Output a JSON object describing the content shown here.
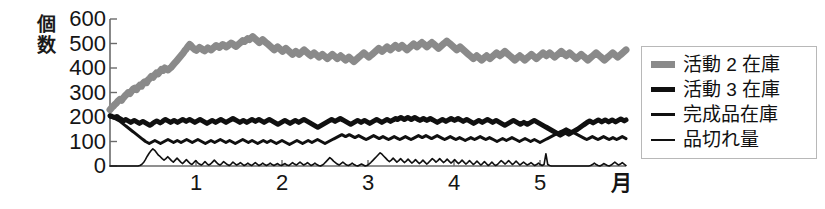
{
  "chart_data": {
    "type": "line",
    "title": "",
    "xlabel": "月",
    "ylabel": "個数",
    "ylim": [
      0,
      600
    ],
    "yticks": [
      0,
      100,
      200,
      300,
      400,
      500,
      600
    ],
    "xlim": [
      0,
      6
    ],
    "xticks": [
      1,
      2,
      3,
      4,
      5
    ],
    "xticklabels": [
      "1",
      "2",
      "3",
      "4",
      "5"
    ],
    "grid": false,
    "legend_position": "right",
    "series": [
      {
        "name": "活動 2 在庫",
        "color": "#8a8a8a",
        "width": 7,
        "values": [
          230,
          238,
          244,
          252,
          258,
          266,
          272,
          268,
          278,
          286,
          292,
          300,
          296,
          306,
          314,
          318,
          312,
          322,
          330,
          326,
          338,
          344,
          340,
          352,
          358,
          366,
          362,
          372,
          380,
          376,
          386,
          394,
          390,
          400,
          396,
          392,
          398,
          404,
          412,
          420,
          428,
          436,
          444,
          452,
          460,
          470,
          478,
          488,
          496,
          490,
          482,
          476,
          472,
          478,
          484,
          480,
          474,
          470,
          476,
          482,
          478,
          474,
          480,
          486,
          492,
          488,
          484,
          490,
          496,
          492,
          486,
          490,
          496,
          502,
          498,
          492,
          488,
          494,
          500,
          506,
          512,
          508,
          514,
          520,
          516,
          522,
          528,
          522,
          516,
          510,
          504,
          510,
          516,
          510,
          504,
          498,
          492,
          486,
          480,
          474,
          480,
          486,
          480,
          474,
          468,
          474,
          480,
          474,
          468,
          462,
          456,
          462,
          468,
          462,
          456,
          462,
          468,
          474,
          468,
          462,
          456,
          450,
          456,
          462,
          456,
          450,
          444,
          450,
          456,
          450,
          444,
          438,
          444,
          450,
          456,
          450,
          444,
          438,
          444,
          450,
          444,
          438,
          432,
          438,
          444,
          438,
          432,
          426,
          432,
          438,
          444,
          450,
          456,
          462,
          456,
          450,
          444,
          450,
          456,
          462,
          468,
          474,
          480,
          474,
          468,
          474,
          480,
          486,
          480,
          474,
          480,
          486,
          492,
          486,
          480,
          486,
          492,
          486,
          480,
          474,
          480,
          486,
          492,
          498,
          492,
          486,
          492,
          498,
          504,
          498,
          492,
          486,
          492,
          498,
          504,
          498,
          492,
          486,
          480,
          486,
          492,
          498,
          504,
          510,
          504,
          498,
          492,
          486,
          480,
          474,
          480,
          486,
          480,
          474,
          468,
          462,
          456,
          450,
          444,
          438,
          444,
          450,
          444,
          438,
          432,
          438,
          444,
          450,
          444,
          438,
          444,
          450,
          456,
          462,
          456,
          450,
          456,
          462,
          468,
          462,
          456,
          450,
          444,
          438,
          432,
          438,
          444,
          450,
          444,
          438,
          432,
          438,
          444,
          450,
          456,
          450,
          444,
          438,
          444,
          450,
          456,
          462,
          456,
          450,
          456,
          462,
          456,
          450,
          444,
          450,
          456,
          462,
          468,
          462,
          456,
          450,
          456,
          462,
          456,
          450,
          444,
          438,
          444,
          450,
          456,
          450,
          444,
          438,
          432,
          438,
          444,
          450,
          456,
          462,
          456,
          450,
          444,
          438,
          432,
          438,
          444,
          450,
          456,
          462,
          456,
          450,
          444,
          450,
          456,
          462,
          468,
          474
        ]
      },
      {
        "name": "活動 3 在庫",
        "color": "#101010",
        "width": 5,
        "values": [
          205,
          203,
          200,
          198,
          202,
          196,
          192,
          188,
          185,
          190,
          186,
          182,
          178,
          182,
          186,
          182,
          178,
          174,
          178,
          182,
          178,
          174,
          170,
          166,
          170,
          176,
          180,
          184,
          180,
          176,
          180,
          186,
          190,
          186,
          182,
          178,
          182,
          186,
          182,
          178,
          182,
          186,
          190,
          186,
          182,
          186,
          190,
          186,
          182,
          178,
          182,
          186,
          190,
          186,
          182,
          178,
          174,
          178,
          182,
          186,
          182,
          178,
          182,
          186,
          190,
          186,
          182,
          178,
          182,
          186,
          190,
          194,
          190,
          186,
          182,
          178,
          182,
          186,
          182,
          178,
          182,
          186,
          190,
          186,
          182,
          186,
          190,
          186,
          182,
          178,
          182,
          186,
          190,
          186,
          182,
          178,
          174,
          170,
          174,
          178,
          182,
          186,
          182,
          178,
          174,
          178,
          182,
          186,
          182,
          178,
          182,
          186,
          190,
          186,
          182,
          178,
          174,
          170,
          166,
          162,
          158,
          162,
          166,
          170,
          174,
          178,
          182,
          186,
          190,
          186,
          182,
          186,
          190,
          194,
          190,
          186,
          182,
          178,
          174,
          170,
          174,
          178,
          182,
          186,
          182,
          178,
          182,
          186,
          182,
          178,
          174,
          178,
          182,
          186,
          190,
          186,
          182,
          178,
          182,
          186,
          190,
          186,
          182,
          186,
          190,
          194,
          190,
          194,
          198,
          194,
          190,
          194,
          198,
          194,
          190,
          194,
          198,
          194,
          190,
          186,
          190,
          194,
          190,
          186,
          190,
          194,
          190,
          186,
          182,
          178,
          182,
          186,
          190,
          186,
          182,
          186,
          190,
          194,
          190,
          186,
          190,
          194,
          190,
          186,
          182,
          186,
          190,
          186,
          182,
          178,
          174,
          178,
          182,
          186,
          182,
          178,
          182,
          186,
          190,
          186,
          182,
          178,
          182,
          186,
          182,
          178,
          174,
          170,
          166,
          170,
          174,
          178,
          182,
          186,
          182,
          178,
          174,
          170,
          174,
          178,
          174,
          170,
          174,
          178,
          182,
          186,
          182,
          178,
          174,
          170,
          166,
          162,
          158,
          154,
          150,
          146,
          142,
          138,
          134,
          130,
          126,
          130,
          134,
          138,
          134,
          130,
          134,
          138,
          142,
          146,
          150,
          155,
          160,
          165,
          170,
          175,
          180,
          184,
          180,
          176,
          180,
          184,
          188,
          184,
          180,
          184,
          188,
          184,
          180,
          184,
          188,
          184,
          180,
          184,
          188,
          192,
          188,
          184,
          188
        ]
      },
      {
        "name": "完成品在庫",
        "color": "#101010",
        "width": 3,
        "values": [
          200,
          198,
          196,
          192,
          188,
          184,
          178,
          172,
          166,
          160,
          154,
          148,
          142,
          136,
          130,
          124,
          118,
          112,
          106,
          100,
          96,
          92,
          96,
          100,
          104,
          100,
          96,
          92,
          96,
          100,
          104,
          108,
          104,
          100,
          96,
          100,
          104,
          100,
          96,
          100,
          104,
          108,
          104,
          100,
          96,
          100,
          104,
          108,
          104,
          100,
          96,
          92,
          96,
          100,
          104,
          100,
          96,
          100,
          104,
          108,
          104,
          100,
          96,
          100,
          104,
          100,
          96,
          92,
          96,
          100,
          104,
          108,
          104,
          100,
          96,
          100,
          104,
          100,
          96,
          92,
          96,
          100,
          104,
          100,
          96,
          100,
          104,
          100,
          96,
          92,
          96,
          100,
          104,
          100,
          96,
          92,
          88,
          92,
          96,
          100,
          104,
          100,
          96,
          92,
          96,
          100,
          104,
          100,
          96,
          100,
          104,
          108,
          104,
          100,
          96,
          92,
          96,
          100,
          104,
          108,
          112,
          116,
          120,
          124,
          128,
          124,
          120,
          124,
          128,
          124,
          120,
          116,
          120,
          124,
          120,
          116,
          112,
          108,
          112,
          116,
          120,
          124,
          120,
          116,
          112,
          116,
          120,
          116,
          112,
          108,
          112,
          116,
          120,
          116,
          112,
          108,
          112,
          116,
          120,
          116,
          112,
          108,
          112,
          116,
          120,
          124,
          120,
          116,
          120,
          124,
          120,
          116,
          112,
          116,
          120,
          124,
          120,
          116,
          112,
          108,
          112,
          116,
          120,
          116,
          112,
          108,
          112,
          116,
          112,
          108,
          104,
          108,
          112,
          116,
          112,
          108,
          112,
          116,
          120,
          116,
          112,
          108,
          112,
          116,
          112,
          108,
          104,
          100,
          104,
          108,
          112,
          108,
          104,
          108,
          112,
          116,
          112,
          108,
          104,
          100,
          104,
          108,
          112,
          108,
          104,
          100,
          104,
          108,
          104,
          100,
          96,
          100,
          104,
          108,
          112,
          116,
          120,
          124,
          128,
          132,
          136,
          140,
          144,
          148,
          152,
          148,
          144,
          140,
          136,
          132,
          128,
          124,
          120,
          116,
          112,
          108,
          112,
          116,
          120,
          116,
          112,
          108,
          112,
          116,
          120,
          116,
          112,
          108,
          112,
          116,
          112,
          108,
          112,
          116,
          120,
          116,
          112
        ]
      },
      {
        "name": "品切れ量",
        "color": "#101010",
        "width": 1.6,
        "values": [
          0,
          0,
          0,
          0,
          0,
          0,
          0,
          0,
          0,
          0,
          0,
          0,
          0,
          0,
          0,
          0,
          2,
          6,
          14,
          26,
          40,
          52,
          62,
          70,
          64,
          54,
          44,
          38,
          30,
          24,
          30,
          38,
          30,
          22,
          16,
          24,
          32,
          24,
          16,
          10,
          18,
          26,
          18,
          10,
          6,
          14,
          22,
          14,
          8,
          4,
          10,
          18,
          10,
          4,
          8,
          16,
          24,
          16,
          8,
          4,
          10,
          18,
          12,
          6,
          2,
          8,
          16,
          10,
          4,
          8,
          14,
          8,
          2,
          6,
          12,
          6,
          2,
          8,
          14,
          8,
          2,
          6,
          12,
          6,
          2,
          6,
          12,
          6,
          2,
          6,
          10,
          4,
          2,
          6,
          10,
          4,
          2,
          8,
          14,
          8,
          4,
          10,
          16,
          10,
          4,
          8,
          14,
          8,
          2,
          6,
          12,
          6,
          2,
          0,
          4,
          10,
          18,
          26,
          34,
          28,
          20,
          14,
          8,
          4,
          10,
          16,
          10,
          4,
          2,
          6,
          12,
          6,
          2,
          0,
          4,
          8,
          4,
          0,
          2,
          8,
          14,
          22,
          30,
          38,
          46,
          54,
          48,
          40,
          32,
          24,
          18,
          24,
          32,
          24,
          16,
          22,
          30,
          22,
          14,
          20,
          28,
          20,
          12,
          18,
          26,
          18,
          10,
          16,
          24,
          16,
          8,
          14,
          22,
          30,
          24,
          16,
          22,
          30,
          22,
          14,
          20,
          28,
          20,
          12,
          18,
          26,
          18,
          10,
          16,
          24,
          16,
          8,
          14,
          22,
          14,
          6,
          12,
          20,
          12,
          4,
          10,
          18,
          10,
          2,
          8,
          16,
          8,
          2,
          6,
          14,
          22,
          16,
          8,
          14,
          22,
          14,
          6,
          12,
          20,
          12,
          4,
          10,
          16,
          10,
          4,
          8,
          14,
          8,
          2,
          6,
          12,
          6,
          2,
          6,
          50,
          6,
          2,
          0,
          0,
          0,
          0,
          0,
          0,
          0,
          0,
          0,
          0,
          0,
          0,
          0,
          0,
          0,
          0,
          0,
          0,
          0,
          0,
          0,
          2,
          6,
          12,
          6,
          2,
          0,
          4,
          10,
          6,
          2,
          0,
          4,
          10,
          16,
          10,
          4,
          8,
          14,
          8,
          2
        ]
      }
    ]
  },
  "axis": {
    "y_title_chars": [
      "個",
      "数"
    ],
    "y_tick_labels": [
      "600",
      "500",
      "400",
      "300",
      "200",
      "100",
      "0"
    ],
    "x_tick_labels": [
      "1",
      "2",
      "3",
      "4",
      "5"
    ],
    "x_title": "月"
  },
  "legend": {
    "items": [
      {
        "label": "活動 2 在庫",
        "swatch": "thick-gray-line-icon"
      },
      {
        "label": "活動 3 在庫",
        "swatch": "thick-black-line-icon"
      },
      {
        "label": "完成品在庫",
        "swatch": "medium-black-line-icon"
      },
      {
        "label": "品切れ量",
        "swatch": "thin-black-line-icon"
      }
    ]
  },
  "colors": {
    "series_gray": "#8a8a8a",
    "series_black": "#101010",
    "axis": "#6b6b6b",
    "text": "#151515",
    "background": "#ffffff",
    "legend_border": "#b8b8b8"
  }
}
